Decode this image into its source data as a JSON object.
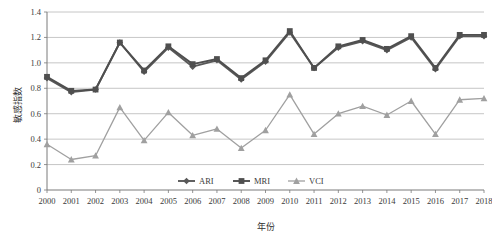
{
  "chart_data": {
    "type": "line",
    "title": "",
    "xlabel": "年份",
    "ylabel": "敏感指数",
    "x": [
      2000,
      2001,
      2002,
      2003,
      2004,
      2005,
      2006,
      2007,
      2008,
      2009,
      2010,
      2011,
      2012,
      2013,
      2014,
      2015,
      2016,
      2017,
      2018
    ],
    "categories": [
      "2000",
      "2001",
      "2002",
      "2003",
      "2004",
      "2005",
      "2006",
      "2007",
      "2008",
      "2009",
      "2010",
      "2011",
      "2012",
      "2013",
      "2014",
      "2015",
      "2016",
      "2017",
      "2018"
    ],
    "ylim": [
      0,
      1.4
    ],
    "yticks": [
      "0",
      "0.2",
      "0.4",
      "0.6",
      "0.8",
      "1.0",
      "1.2",
      "1.4"
    ],
    "ytick_values": [
      0,
      0.2,
      0.4,
      0.6,
      0.8,
      1.0,
      1.2,
      1.4
    ],
    "grid": true,
    "legend_position": "inside-bottom-center",
    "series": [
      {
        "name": "ARI",
        "marker": "diamond",
        "color": "#595959",
        "values": [
          0.88,
          0.77,
          0.79,
          1.16,
          0.93,
          1.12,
          0.97,
          1.02,
          0.87,
          1.01,
          1.24,
          0.96,
          1.12,
          1.17,
          1.1,
          1.2,
          0.95,
          1.21,
          1.21
        ]
      },
      {
        "name": "MRI",
        "marker": "square",
        "color": "#4f4f4f",
        "values": [
          0.89,
          0.78,
          0.79,
          1.16,
          0.94,
          1.13,
          0.99,
          1.03,
          0.88,
          1.02,
          1.25,
          0.96,
          1.13,
          1.18,
          1.11,
          1.21,
          0.96,
          1.22,
          1.22
        ]
      },
      {
        "name": "VCI",
        "marker": "triangle",
        "color": "#a0a0a0",
        "values": [
          0.36,
          0.24,
          0.27,
          0.65,
          0.39,
          0.61,
          0.43,
          0.48,
          0.33,
          0.47,
          0.75,
          0.44,
          0.6,
          0.66,
          0.59,
          0.7,
          0.44,
          0.71,
          0.72
        ]
      }
    ]
  },
  "legend": {
    "items": [
      {
        "label": "ARI"
      },
      {
        "label": "MRI"
      },
      {
        "label": "VCI"
      }
    ]
  },
  "colors": {
    "grid": "#b8b8b8",
    "axis": "#7a7a7a",
    "text": "#3a3a3a",
    "ari": "#595959",
    "mri": "#4f4f4f",
    "vci": "#a0a0a0",
    "background": "#ffffff"
  }
}
